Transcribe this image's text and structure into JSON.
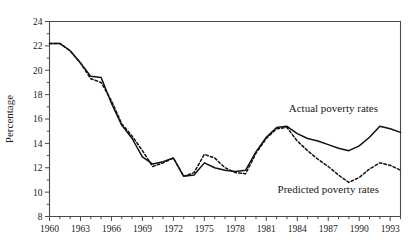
{
  "chart_data": {
    "type": "line",
    "title": "",
    "xlabel": "",
    "ylabel": "Percentage",
    "xlim": [
      1960,
      1994
    ],
    "ylim": [
      8,
      24
    ],
    "grid": false,
    "legend_position": "inline-annotations",
    "x_tick_labels": [
      "1960",
      "1963",
      "1966",
      "1969",
      "1972",
      "1975",
      "1978",
      "1981",
      "1984",
      "1987",
      "1990",
      "1993"
    ],
    "x_tick_values": [
      1960,
      1963,
      1966,
      1969,
      1972,
      1975,
      1978,
      1981,
      1984,
      1987,
      1990,
      1993
    ],
    "x_minor_ticks": [
      1960,
      1961,
      1962,
      1963,
      1964,
      1965,
      1966,
      1967,
      1968,
      1969,
      1970,
      1971,
      1972,
      1973,
      1974,
      1975,
      1976,
      1977,
      1978,
      1979,
      1980,
      1981,
      1982,
      1983,
      1984,
      1985,
      1986,
      1987,
      1988,
      1989,
      1990,
      1991,
      1992,
      1993,
      1994
    ],
    "y_tick_labels": [
      "8",
      "10",
      "12",
      "14",
      "16",
      "18",
      "20",
      "22",
      "24"
    ],
    "y_tick_values": [
      8,
      10,
      12,
      14,
      16,
      18,
      20,
      22,
      24
    ],
    "y_minor_ticks": [
      9,
      11,
      13,
      15,
      17,
      19,
      21,
      23
    ],
    "x": [
      1960,
      1961,
      1962,
      1963,
      1964,
      1965,
      1966,
      1967,
      1968,
      1969,
      1970,
      1971,
      1972,
      1973,
      1974,
      1975,
      1976,
      1977,
      1978,
      1979,
      1980,
      1981,
      1982,
      1983,
      1984,
      1985,
      1986,
      1987,
      1988,
      1989,
      1990,
      1991,
      1992,
      1993,
      1994
    ],
    "series": [
      {
        "name": "Actual poverty rates",
        "style": "solid",
        "color": "#111111",
        "annotation": "Actual poverty rates",
        "values": [
          22.2,
          22.2,
          21.6,
          20.6,
          19.5,
          19.4,
          17.3,
          15.5,
          14.4,
          12.9,
          12.3,
          12.5,
          12.8,
          11.3,
          11.4,
          12.4,
          12.0,
          11.8,
          11.7,
          11.8,
          13.3,
          14.5,
          15.3,
          15.4,
          14.8,
          14.4,
          14.2,
          13.9,
          13.6,
          13.4,
          13.8,
          14.5,
          15.4,
          15.2,
          14.9
        ]
      },
      {
        "name": "Predicted poverty rates",
        "style": "dashed",
        "color": "#111111",
        "annotation": "Predicted poverty rates",
        "values": [
          22.2,
          22.2,
          21.6,
          20.6,
          19.3,
          19.0,
          17.5,
          15.6,
          14.6,
          13.4,
          12.1,
          12.4,
          12.8,
          11.3,
          11.6,
          13.1,
          12.8,
          12.0,
          11.6,
          11.5,
          13.2,
          14.4,
          15.2,
          15.3,
          14.2,
          13.4,
          12.7,
          12.1,
          11.4,
          10.8,
          11.2,
          11.9,
          12.4,
          12.2,
          11.8
        ]
      }
    ],
    "annotations": [
      {
        "text": "Actual poverty rates",
        "x": 1987.5,
        "y": 16.6
      },
      {
        "text": "Predicted poverty rates",
        "x": 1987.0,
        "y": 9.9
      }
    ]
  }
}
